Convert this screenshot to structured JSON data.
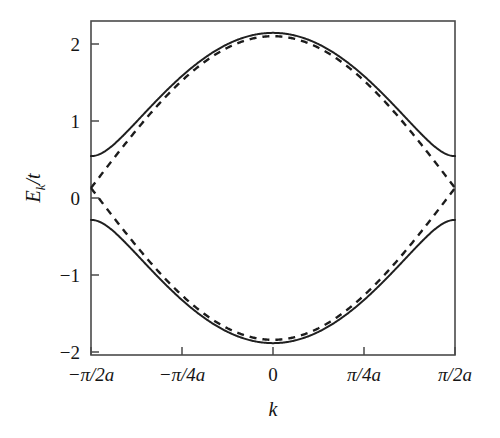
{
  "figure": {
    "name": "band-dispersion-plot",
    "background": "#ffffff",
    "ink_color": "#202020"
  },
  "chart_data": {
    "type": "line",
    "title": "",
    "subtitle": "",
    "xlabel": "k",
    "ylabel": "E_k/t",
    "xlim": [
      -1.5707963,
      1.5707963
    ],
    "ylim": [
      -2.2,
      2.2
    ],
    "grid": false,
    "legend": "none",
    "x_tick_values": [
      -1.5707963,
      -0.7853982,
      0,
      0.7853982,
      1.5707963
    ],
    "x_tick_labels": [
      "−π/2a",
      "−π/4a",
      "0",
      "π/4a",
      "π/2a"
    ],
    "y_tick_values": [
      2,
      1,
      0,
      -1,
      -2
    ],
    "y_tick_labels": [
      "2",
      "1",
      "0",
      "−1",
      "−2"
    ],
    "x_axis_note": "k in units of 1/a over the reduced Brillouin zone",
    "y_axis_note": "energy in units of the hopping t",
    "gap_half_width": 0.42,
    "band_max": 2.0,
    "band_min": -2.0,
    "series": [
      {
        "name": "upper-gapped-band",
        "style": "solid",
        "formula": "sqrt((2*cos(k*a))^2 + 0.42^2)",
        "x": [
          -1.5707963,
          -1.4726216,
          -1.3744468,
          -1.2762721,
          -1.1780973,
          -1.0799225,
          -0.9817478,
          -0.883573,
          -0.7853982,
          -0.6872234,
          -0.5890487,
          -0.4908739,
          -0.3926991,
          -0.2945244,
          -0.1963496,
          -0.0981748,
          0,
          0.0981748,
          0.1963496,
          0.2945244,
          0.3926991,
          0.4908739,
          0.5890487,
          0.6872234,
          0.7853982,
          0.883573,
          0.9817478,
          1.0799225,
          1.1780973,
          1.2762721,
          1.3744468,
          1.4726216,
          1.5707963
        ],
        "y": [
          0.42,
          0.445,
          0.518,
          0.628,
          0.765,
          0.921,
          1.09,
          1.266,
          1.444,
          1.618,
          1.783,
          1.932,
          2.0,
          1.932,
          1.783,
          1.618,
          1.444,
          1.618,
          1.783,
          1.932,
          2.0,
          1.932,
          1.783,
          1.618,
          1.444,
          1.266,
          1.09,
          0.921,
          0.765,
          0.628,
          0.518,
          0.445,
          0.42
        ]
      },
      {
        "name": "lower-gapped-band",
        "style": "solid",
        "formula": "-sqrt((2*cos(k*a))^2 + 0.42^2)",
        "mirror_of": "upper-gapped-band"
      },
      {
        "name": "upper-ungapped-band",
        "style": "dashed",
        "formula": "2*|cos(k*a)|",
        "x": [
          -1.5707963,
          -1.3744468,
          -1.1780973,
          -0.9817478,
          -0.7853982,
          -0.5890487,
          -0.3926991,
          -0.1963496,
          0,
          0.1963496,
          0.3926991,
          0.5890487,
          0.7853982,
          0.9817478,
          1.1780973,
          1.3744468,
          1.5707963
        ],
        "y": [
          0,
          0.39,
          0.765,
          1.111,
          1.414,
          1.663,
          1.848,
          1.962,
          2.0,
          1.962,
          1.848,
          1.663,
          1.414,
          1.111,
          0.765,
          0.39,
          0
        ]
      },
      {
        "name": "lower-ungapped-band",
        "style": "dashed",
        "formula": "-2*|cos(k*a)|",
        "mirror_of": "upper-ungapped-band"
      }
    ]
  }
}
